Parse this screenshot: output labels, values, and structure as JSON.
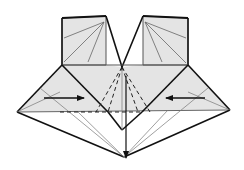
{
  "diagram": {
    "type": "origami-fold-diagram",
    "colors": {
      "paper_fill": "#e4e4e4",
      "background": "#ffffff",
      "edge": "#111111",
      "crease": "#555555",
      "valley": "#222222"
    },
    "elements": {
      "left_flap": "left-square-flap",
      "right_flap": "right-square-flap",
      "center_point": "center-vertex",
      "left_arrow": "arrow-right",
      "right_arrow": "arrow-left",
      "down_arrow": "arrow-down"
    }
  }
}
